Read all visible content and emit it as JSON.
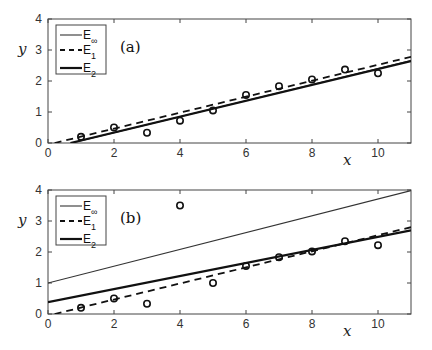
{
  "chart_data": [
    {
      "type": "line",
      "panel_label": "(a)",
      "xlabel": "x",
      "ylabel": "y",
      "xlim": [
        0,
        11
      ],
      "ylim": [
        0,
        4
      ],
      "x_ticks": [
        0,
        2,
        4,
        6,
        8,
        10
      ],
      "y_ticks": [
        0,
        1,
        2,
        3,
        4
      ],
      "grid": false,
      "legend_position": "upper left",
      "legend": [
        {
          "name": "E",
          "sub": "∞",
          "style": "thin-solid"
        },
        {
          "name": "E",
          "sub": "1",
          "style": "dashed"
        },
        {
          "name": "E",
          "sub": "2",
          "style": "thick-solid"
        }
      ],
      "scatter": {
        "marker": "circle-open",
        "x": [
          1,
          2,
          3,
          4,
          5,
          6,
          7,
          8,
          9,
          10
        ],
        "y": [
          0.2,
          0.5,
          0.33,
          0.72,
          1.05,
          1.55,
          1.83,
          2.05,
          2.37,
          2.25
        ]
      },
      "series": [
        {
          "name": "E∞",
          "style": "thin-solid",
          "x": [
            0.72,
            11
          ],
          "y": [
            0,
            2.66
          ]
        },
        {
          "name": "E1",
          "style": "dashed",
          "x": [
            0.2,
            11
          ],
          "y": [
            0,
            2.78
          ]
        },
        {
          "name": "E2",
          "style": "thick-solid",
          "x": [
            0.68,
            11
          ],
          "y": [
            0,
            2.64
          ]
        }
      ]
    },
    {
      "type": "line",
      "panel_label": "(b)",
      "xlabel": "x",
      "ylabel": "y",
      "xlim": [
        0,
        11
      ],
      "ylim": [
        0,
        4
      ],
      "x_ticks": [
        0,
        2,
        4,
        6,
        8,
        10
      ],
      "y_ticks": [
        0,
        1,
        2,
        3,
        4
      ],
      "grid": false,
      "legend_position": "upper left",
      "legend": [
        {
          "name": "E",
          "sub": "∞",
          "style": "thin-solid"
        },
        {
          "name": "E",
          "sub": "1",
          "style": "dashed"
        },
        {
          "name": "E",
          "sub": "2",
          "style": "thick-solid"
        }
      ],
      "scatter": {
        "marker": "circle-open",
        "x": [
          1,
          2,
          3,
          4,
          5,
          6,
          7,
          8,
          9,
          10
        ],
        "y": [
          0.2,
          0.5,
          0.33,
          3.5,
          1.0,
          1.55,
          1.83,
          2.02,
          2.35,
          2.22
        ]
      },
      "series": [
        {
          "name": "E∞",
          "style": "thin-solid",
          "x": [
            0,
            11
          ],
          "y": [
            1.0,
            3.98
          ]
        },
        {
          "name": "E1",
          "style": "dashed",
          "x": [
            0.2,
            11
          ],
          "y": [
            0,
            2.8
          ]
        },
        {
          "name": "E2",
          "style": "thick-solid",
          "x": [
            0,
            11
          ],
          "y": [
            0.38,
            2.7
          ]
        }
      ]
    }
  ]
}
